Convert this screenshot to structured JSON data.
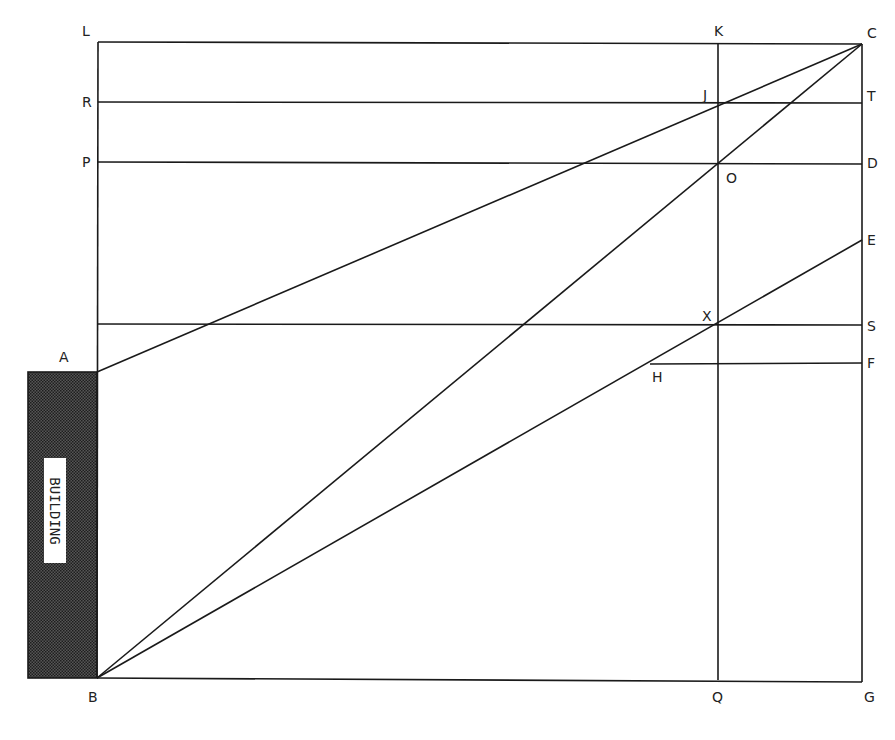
{
  "diagram": {
    "title": "",
    "building_label": "BUILDING",
    "points": {
      "L": "L",
      "K": "K",
      "C": "C",
      "R": "R",
      "J": "J",
      "T": "T",
      "P": "P",
      "O": "O",
      "D": "D",
      "E": "E",
      "X": "X",
      "S": "S",
      "A": "A",
      "H": "H",
      "F": "F",
      "B": "B",
      "Q": "Q",
      "G": "G"
    },
    "colors": {
      "line": "#1a1a1a",
      "building_fill": "#3a3a3a"
    }
  }
}
